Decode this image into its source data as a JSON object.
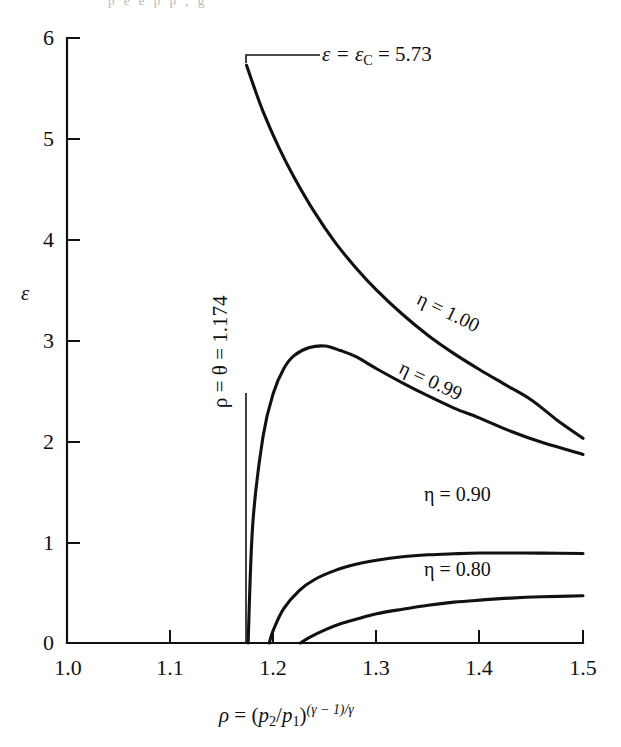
{
  "figure": {
    "background_color": "#ffffff",
    "ink_color": "#111111",
    "bleed_text": "p    e    e    p    p        ,  g"
  },
  "chart_data": {
    "type": "line",
    "title": "",
    "xlabel": "ρ = (p₂/p₁)^((γ−1)/γ)",
    "ylabel": "ε",
    "xlim": [
      1.0,
      1.5
    ],
    "ylim": [
      0,
      6
    ],
    "grid": false,
    "legend_position": "inline-curve-labels",
    "xticks": [
      1.0,
      1.1,
      1.2,
      1.3,
      1.4,
      1.5
    ],
    "xtick_labels": [
      "1.0",
      "1.1",
      "1.2",
      "1.3",
      "1.4",
      "1.5"
    ],
    "yticks": [
      0,
      1,
      2,
      3,
      4,
      5,
      6
    ],
    "ytick_labels": [
      "0",
      "1",
      "2",
      "3",
      "4",
      "5",
      "6"
    ],
    "series": [
      {
        "name": "η = 1.00",
        "eta": 1.0,
        "label": "η = 1.00",
        "x": [
          1.174,
          1.18,
          1.19,
          1.205,
          1.22,
          1.24,
          1.26,
          1.28,
          1.3,
          1.325,
          1.35,
          1.375,
          1.4,
          1.425,
          1.45,
          1.475,
          1.5
        ],
        "y": [
          5.73,
          5.55,
          5.27,
          4.92,
          4.62,
          4.27,
          3.97,
          3.72,
          3.5,
          3.26,
          3.05,
          2.87,
          2.71,
          2.56,
          2.41,
          2.21,
          2.03
        ]
      },
      {
        "name": "η = 0.99",
        "eta": 0.99,
        "label": "η = 0.99",
        "x": [
          1.1755,
          1.18,
          1.19,
          1.2,
          1.21,
          1.22,
          1.235,
          1.25,
          1.265,
          1.28,
          1.3,
          1.325,
          1.35,
          1.375,
          1.4,
          1.43,
          1.46,
          1.5
        ],
        "y": [
          0.0,
          1.18,
          2.05,
          2.48,
          2.72,
          2.85,
          2.93,
          2.945,
          2.9,
          2.84,
          2.72,
          2.58,
          2.45,
          2.33,
          2.23,
          2.1,
          1.99,
          1.87
        ]
      },
      {
        "name": "η = 0.90",
        "eta": 0.9,
        "label": "η = 0.90",
        "x": [
          1.196,
          1.2,
          1.21,
          1.225,
          1.24,
          1.26,
          1.28,
          1.3,
          1.325,
          1.35,
          1.375,
          1.4,
          1.43,
          1.46,
          1.5
        ],
        "y": [
          0.0,
          0.13,
          0.34,
          0.52,
          0.63,
          0.72,
          0.78,
          0.82,
          0.855,
          0.875,
          0.885,
          0.892,
          0.893,
          0.891,
          0.888
        ]
      },
      {
        "name": "η = 0.80",
        "eta": 0.8,
        "label": "η = 0.80",
        "x": [
          1.226,
          1.235,
          1.25,
          1.265,
          1.28,
          1.3,
          1.325,
          1.35,
          1.375,
          1.4,
          1.43,
          1.46,
          1.5
        ],
        "y": [
          0.0,
          0.055,
          0.13,
          0.19,
          0.235,
          0.29,
          0.335,
          0.375,
          0.405,
          0.425,
          0.445,
          0.458,
          0.468
        ]
      }
    ],
    "annotations": [
      {
        "name": "epsilon-critical",
        "text": "ε = εC = 5.73",
        "value": 5.73,
        "at_x": 1.174,
        "at_y": 5.73
      },
      {
        "name": "rho-theta-vertical",
        "text": "ρ = θ = 1.174",
        "value": 1.174,
        "at_x": 1.174
      }
    ]
  },
  "axis": {
    "y_title": "ε",
    "x_title_parts": {
      "rho": "ρ",
      "equals": " = (",
      "p2": "p",
      "sub2": "2",
      "slash": "/",
      "p1": "p",
      "sub1": "1",
      "close": ")",
      "exponent": "(γ − 1)/γ"
    }
  },
  "annotation_text": {
    "eps_crit_lhs": "ε = ε",
    "eps_crit_sub": "C",
    "eps_crit_rhs": " = 5.73",
    "rho_theta": "ρ = θ = 1.174"
  },
  "curve_labels": {
    "eta_100": "η = 1.00",
    "eta_099": "η = 0.99",
    "eta_090": "η = 0.90",
    "eta_080": "η = 0.80"
  }
}
